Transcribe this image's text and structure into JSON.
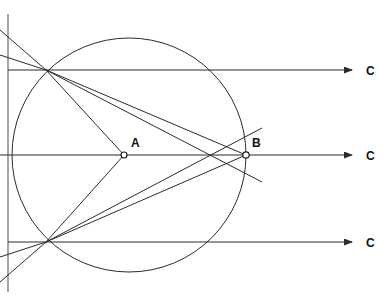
{
  "figure": {
    "kind": "geometric-ray-diagram",
    "background_color": "#ffffff",
    "line_color": "#2b2b2b",
    "axis_color": "#5a5a66",
    "label_color": "#111111",
    "width": 387,
    "height": 300,
    "header_text": "",
    "labels": {
      "point_a": "A",
      "point_b": "B",
      "ray_top": "C",
      "ray_middle": "C",
      "ray_bottom": "C"
    },
    "points": {
      "a": {
        "label": "A",
        "x": 124,
        "y": 155
      },
      "b": {
        "label": "B",
        "x": 246,
        "y": 155
      },
      "upper_intersection": {
        "x": 46,
        "y": 70
      },
      "lower_intersection": {
        "x": 46,
        "y": 242
      }
    },
    "circle": {
      "center_x": 129,
      "center_y": 155,
      "radius": 117
    },
    "vertical_axis": {
      "x": 8,
      "y_top": 14,
      "y_bottom": 292
    },
    "horizontal_rays": [
      {
        "name": "ray-top",
        "y": 70,
        "x_start": 8,
        "x_end": 355,
        "label": "C",
        "label_x": 370
      },
      {
        "name": "ray-middle",
        "y": 155,
        "x_start": 0,
        "x_end": 355,
        "label": "C",
        "label_x": 370
      },
      {
        "name": "ray-bottom",
        "y": 242,
        "x_start": 8,
        "x_end": 355,
        "label": "C",
        "label_x": 370
      }
    ],
    "chords": [
      {
        "name": "chord-upper-to-b",
        "x1": 46,
        "y1": 70,
        "x2": 246,
        "y2": 155
      },
      {
        "name": "chord-upper-to-a",
        "x1": 46,
        "y1": 70,
        "x2": 124,
        "y2": 155
      },
      {
        "name": "chord-lower-to-a",
        "x1": 46,
        "y1": 242,
        "x2": 124,
        "y2": 155
      },
      {
        "name": "chord-lower-to-b",
        "x1": 46,
        "y1": 242,
        "x2": 246,
        "y2": 155
      }
    ],
    "incident_rays": [
      {
        "name": "incident-upper-steep",
        "x1": 0,
        "y1": 30,
        "x2": 46,
        "y2": 70
      },
      {
        "name": "incident-upper-shallow",
        "x1": 0,
        "y1": 55,
        "x2": 46,
        "y2": 70
      },
      {
        "name": "incident-lower-steep",
        "x1": 0,
        "y1": 282,
        "x2": 46,
        "y2": 242
      },
      {
        "name": "incident-lower-shallow",
        "x1": 0,
        "y1": 257,
        "x2": 46,
        "y2": 242
      }
    ],
    "transmitted_rays": [
      {
        "name": "transmitted-upper-long",
        "x1": 46,
        "y1": 70,
        "x2": 262,
        "y2": 182
      },
      {
        "name": "transmitted-lower-long",
        "x1": 46,
        "y1": 242,
        "x2": 262,
        "y2": 128
      }
    ]
  }
}
